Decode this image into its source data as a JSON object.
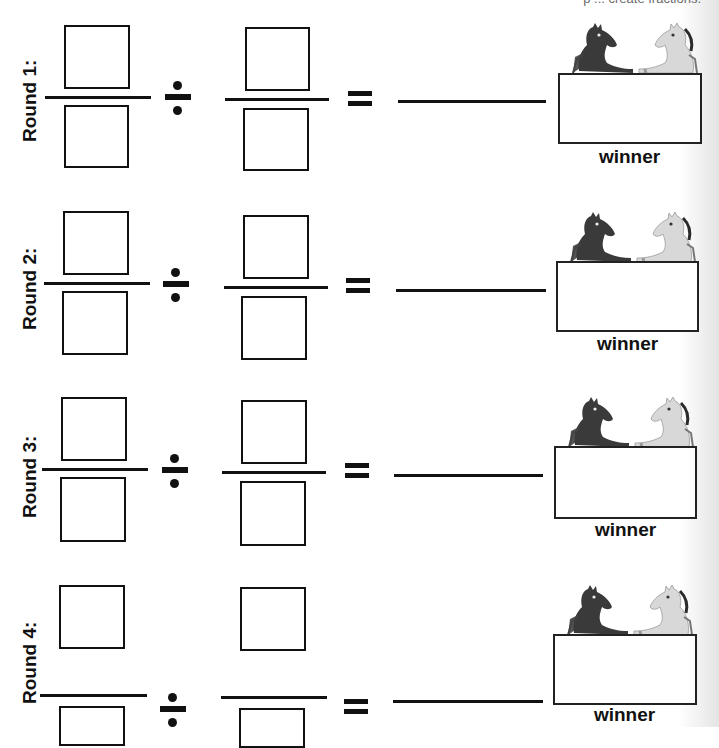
{
  "worksheet": {
    "header_fragment": "p ... create fractions.",
    "rounds": [
      {
        "label": "Round 1:",
        "operator": "÷",
        "equals": "=",
        "winner_label": "winner",
        "horse_icon": "two-horses-icon"
      },
      {
        "label": "Round 2:",
        "operator": "÷",
        "equals": "=",
        "winner_label": "winner",
        "horse_icon": "two-horses-icon"
      },
      {
        "label": "Round 3:",
        "operator": "÷",
        "equals": "=",
        "winner_label": "winner",
        "horse_icon": "two-horses-icon"
      },
      {
        "label": "Round 4:",
        "operator": "÷",
        "equals": "=",
        "winner_label": "winner",
        "horse_icon": "two-horses-icon"
      }
    ],
    "colors": {
      "ink": "#111111",
      "dark_horse": "#3a3a3a",
      "light_horse": "#d8d8d8"
    }
  }
}
